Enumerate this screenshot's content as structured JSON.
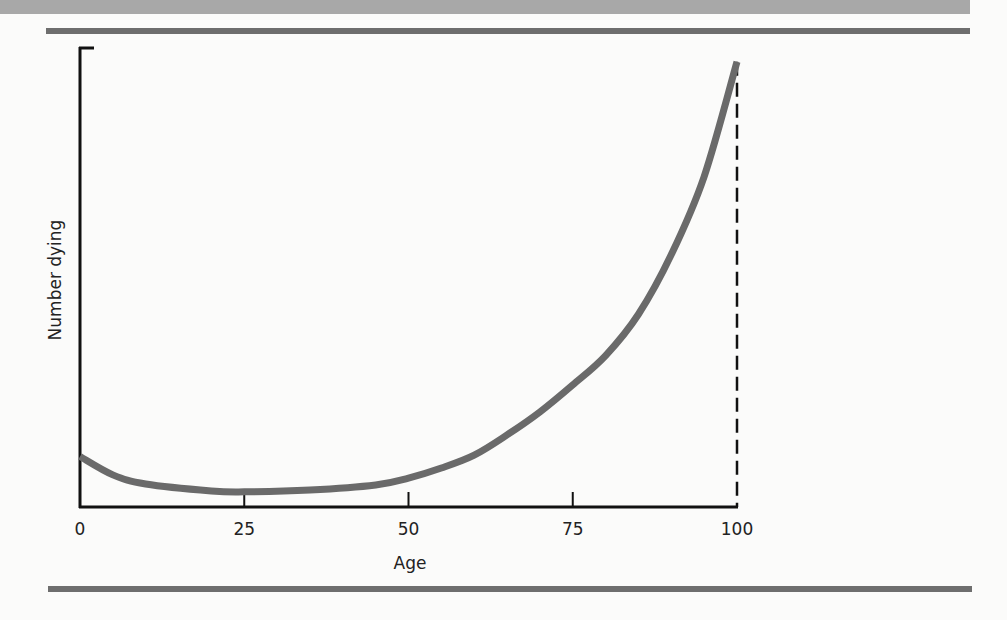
{
  "chart_data": {
    "type": "line",
    "title": "",
    "xlabel": "Age",
    "ylabel": "Number dying",
    "x_ticks": [
      "0",
      "25",
      "50",
      "75",
      "100"
    ],
    "xlim": [
      0,
      100
    ],
    "ylim": [
      0,
      100
    ],
    "y_ticks": [],
    "grid": false,
    "legend": null,
    "annotations": [
      "dashed vertical line at age 100"
    ],
    "series": [
      {
        "name": "Number dying",
        "color": "#6a6a6a",
        "x": [
          0,
          5,
          10,
          20,
          25,
          35,
          45,
          50,
          55,
          60,
          65,
          70,
          75,
          80,
          85,
          90,
          95,
          100
        ],
        "values": [
          11,
          7,
          5,
          3.5,
          3.3,
          3.7,
          4.8,
          6.3,
          8.5,
          11.3,
          15.7,
          20.7,
          26.6,
          33,
          42,
          55,
          72,
          97
        ]
      }
    ]
  },
  "colors": {
    "band": "#a8a8a8",
    "rule": "#6e6e6e",
    "curve": "#6a6a6a",
    "axis": "#111111"
  }
}
